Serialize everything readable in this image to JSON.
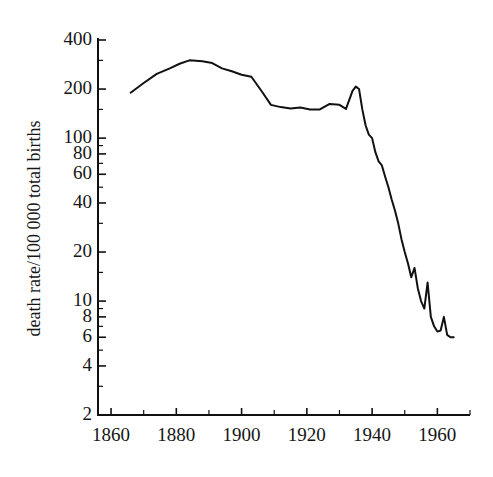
{
  "chart_data": {
    "type": "line",
    "title": "",
    "subtitle": "",
    "xlabel": "",
    "ylabel": "death rate/100 000 total births",
    "yscale": "log",
    "xscale": "linear",
    "xlim": [
      1856,
      1970
    ],
    "ylim": [
      2,
      430
    ],
    "grid": false,
    "legend": null,
    "xticks_major": [
      1860,
      1880,
      1900,
      1920,
      1940,
      1960
    ],
    "xticks_minor": [
      1870,
      1890,
      1910,
      1930,
      1950,
      1970
    ],
    "xtick_labels": [
      "1860",
      "1880",
      "1900",
      "1920",
      "1940",
      "1960"
    ],
    "yticks_labeled": [
      400,
      200,
      100,
      80,
      60,
      40,
      20,
      10,
      8,
      6,
      4,
      2
    ],
    "ytick_labels": [
      "400",
      "200",
      "100",
      "80",
      "60",
      "40",
      "20",
      "10",
      "8",
      "6",
      "4",
      "2"
    ],
    "yticks_minor": [
      300,
      150,
      90,
      70,
      50,
      30,
      15,
      9,
      7,
      5,
      3
    ],
    "line_color": "#111111",
    "line_width": 2.0,
    "series": [
      {
        "name": "maternal mortality",
        "x": [
          1866,
          1870,
          1874,
          1878,
          1881,
          1884,
          1888,
          1891,
          1894,
          1897,
          1900,
          1903,
          1906,
          1909,
          1912,
          1915,
          1918,
          1921,
          1924,
          1927,
          1930,
          1932,
          1934,
          1935,
          1936,
          1937,
          1938,
          1939,
          1940,
          1941,
          1942,
          1943,
          1944,
          1945,
          1946,
          1947,
          1948,
          1949,
          1950,
          1951,
          1952,
          1953,
          1954,
          1955,
          1956,
          1957,
          1958,
          1959,
          1960,
          1961,
          1962,
          1963,
          1964,
          1965
        ],
        "y": [
          190,
          218,
          248,
          268,
          286,
          300,
          296,
          289,
          268,
          257,
          245,
          238,
          196,
          160,
          155,
          152,
          154,
          150,
          150,
          162,
          160,
          151,
          195,
          207,
          200,
          150,
          120,
          105,
          100,
          82,
          72,
          68,
          58,
          50,
          42,
          36,
          30,
          24,
          20,
          17,
          14,
          16,
          12,
          10,
          9,
          13,
          8,
          7,
          6.5,
          6.6,
          8,
          6.2,
          6.0,
          6.0
        ]
      }
    ]
  },
  "axes": {
    "plot_left_px": 98,
    "plot_right_px": 470,
    "plot_top_px": 40,
    "plot_bottom_px": 415
  }
}
